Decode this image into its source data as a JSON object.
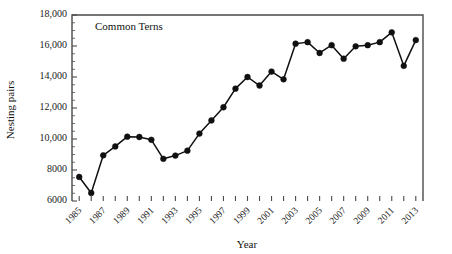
{
  "chart_data": {
    "type": "line",
    "title": "",
    "annotation": "Common Terns",
    "xlabel": "Year",
    "ylabel": "Nesting pairs",
    "grid": false,
    "legend": false,
    "marker": "filled-circle",
    "line_color": "#101010",
    "marker_color": "#101010",
    "axis_color": "#4a4a4a",
    "xlim": [
      1984.4,
      2013.6
    ],
    "ylim": [
      6000,
      18000
    ],
    "ytick_values": [
      6000,
      8000,
      10000,
      12000,
      14000,
      16000,
      18000
    ],
    "ytick_labels": [
      "6000",
      "8000",
      "10,000",
      "12,000",
      "14,000",
      "16,000",
      "18,000"
    ],
    "yminor_step": 500,
    "xtick_values": [
      1985,
      1986,
      1987,
      1988,
      1989,
      1990,
      1991,
      1992,
      1993,
      1994,
      1995,
      1996,
      1997,
      1998,
      1999,
      2000,
      2001,
      2002,
      2003,
      2004,
      2005,
      2006,
      2007,
      2008,
      2009,
      2010,
      2011,
      2012,
      2013
    ],
    "xtick_labels": [
      "1985",
      "",
      "1987",
      "",
      "1989",
      "",
      "1991",
      "",
      "1993",
      "",
      "1995",
      "",
      "1997",
      "",
      "1999",
      "",
      "2001",
      "",
      "2003",
      "",
      "2005",
      "",
      "2007",
      "",
      "2009",
      "",
      "2011",
      "",
      "2013"
    ],
    "xtick_label_rotation": -45,
    "x": [
      1985,
      1986,
      1987,
      1988,
      1989,
      1990,
      1991,
      1992,
      1993,
      1994,
      1995,
      1996,
      1997,
      1998,
      1999,
      2000,
      2001,
      2002,
      2003,
      2004,
      2005,
      2006,
      2007,
      2008,
      2009,
      2010,
      2011,
      2012,
      2013
    ],
    "values": [
      7550,
      6520,
      8950,
      9520,
      10150,
      10130,
      9950,
      8720,
      8930,
      9250,
      10350,
      11200,
      12050,
      13250,
      14000,
      13450,
      14350,
      13850,
      16150,
      16250,
      15550,
      16050,
      15180,
      15980,
      16050,
      16250,
      16880,
      14720,
      16380
    ],
    "series": [
      {
        "name": "Common Terns",
        "values": [
          7550,
          6520,
          8950,
          9520,
          10150,
          10130,
          9950,
          8720,
          8930,
          9250,
          10350,
          11200,
          12050,
          13250,
          14000,
          13450,
          14350,
          13850,
          16150,
          16250,
          15550,
          16050,
          15180,
          15980,
          16050,
          16250,
          16880,
          14720,
          16380
        ]
      }
    ]
  }
}
